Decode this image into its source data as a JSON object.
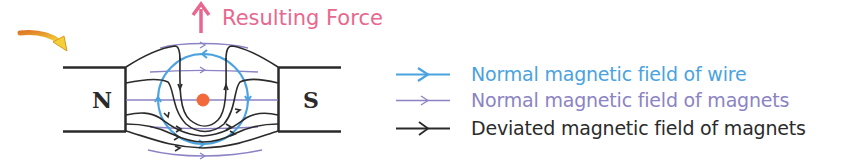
{
  "title_force": {
    "label": "Resulting Force",
    "color": "#e8678f"
  },
  "magnets": {
    "north_label": "N",
    "south_label": "S"
  },
  "wire": {
    "dot_color": "#f26a3c",
    "direction": "out-of-page"
  },
  "legend": {
    "items": [
      {
        "label": "Normal magnetic field of wire",
        "color": "#4aa3e0",
        "icon": "arrow-right-icon"
      },
      {
        "label": "Normal magnetic field of magnets",
        "color": "#8b83c4",
        "icon": "arrow-right-icon"
      },
      {
        "label": "Deviated magnetic field of magnets",
        "color": "#2b2b2b",
        "icon": "arrow-right-icon"
      }
    ]
  },
  "colors": {
    "wire_field": "#4aa3e0",
    "magnet_field_normal": "#8b83c4",
    "magnet_field_deviated": "#2b2b2b",
    "pointer_arrow_start": "#e88a2a",
    "pointer_arrow_end": "#f5d23a"
  }
}
